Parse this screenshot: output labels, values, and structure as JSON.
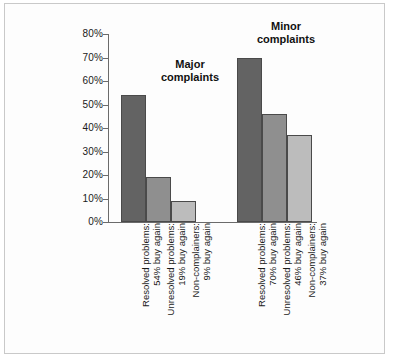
{
  "chart_data": {
    "type": "bar",
    "title": "",
    "xlabel": "",
    "ylabel": "",
    "ylim": [
      0,
      80
    ],
    "ytick_step": 10,
    "ytick_labels": [
      "0%",
      "10%",
      "20%",
      "30%",
      "40%",
      "50%",
      "60%",
      "70%",
      "80%"
    ],
    "ytick_values": [
      0,
      10,
      20,
      30,
      40,
      50,
      60,
      70,
      80
    ],
    "grid": false,
    "legend": false,
    "group_annotations": [
      {
        "name": "major-complaints",
        "line1": "Major",
        "line2": "complaints"
      },
      {
        "name": "minor-complaints",
        "line1": "Minor",
        "line2": "complaints"
      }
    ],
    "groups": [
      {
        "name": "Major complaints",
        "bars": [
          {
            "label_line1": "Resolved problems:",
            "label_line2": "54% buy again",
            "value": 54,
            "color": "#636363"
          },
          {
            "label_line1": "Unresolved problems:",
            "label_line2": "19% buy again",
            "value": 19,
            "color": "#8f8f8f"
          },
          {
            "label_line1": "Non-complainers:",
            "label_line2": "9% buy again",
            "value": 9,
            "color": "#bcbcbc"
          }
        ]
      },
      {
        "name": "Minor complaints",
        "bars": [
          {
            "label_line1": "Resolved problems:",
            "label_line2": "70% buy again",
            "value": 70,
            "color": "#636363"
          },
          {
            "label_line1": "Unresolved problems:",
            "label_line2": "46% buy again",
            "value": 46,
            "color": "#8f8f8f"
          },
          {
            "label_line1": "Non-complainers:",
            "label_line2": "37% buy again",
            "value": 37,
            "color": "#bcbcbc"
          }
        ]
      }
    ],
    "categories": [
      "Resolved problems: 54% buy again",
      "Unresolved problems: 19% buy again",
      "Non-complainers: 9% buy again",
      "Resolved problems: 70% buy again",
      "Unresolved problems: 46% buy again",
      "Non-complainers: 37% buy again"
    ],
    "values": [
      54,
      19,
      9,
      70,
      46,
      37
    ],
    "colors": {
      "dark_bar": "#636363",
      "medium_bar": "#8f8f8f",
      "light_bar": "#bcbcbc",
      "bar_outline": "#4a4a4a",
      "axis": "#6b6b6b",
      "text": "#1a1a1a",
      "frame": "#c9c9c9",
      "background": "#fdfdfd"
    }
  }
}
